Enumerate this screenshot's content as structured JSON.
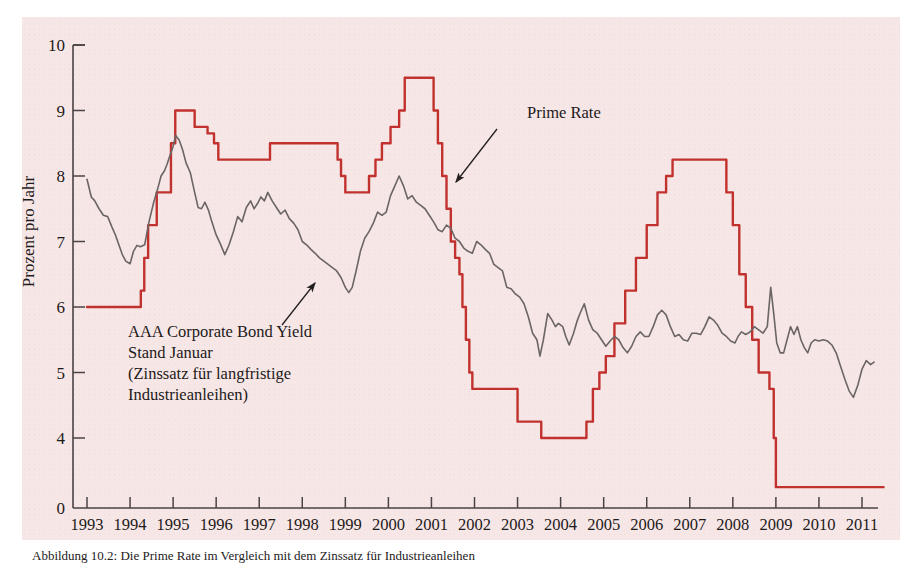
{
  "figure": {
    "background_color": "#ffffff",
    "panel_color": "#f7e6e6",
    "axis_color": "#4a4345",
    "caption": "Abbildung 10.2: Die Prime Rate im Vergleich mit dem Zinssatz für Industrieanleihen"
  },
  "chart_data": {
    "type": "line",
    "title": "",
    "subtitle": "",
    "xlabel": "",
    "ylabel": "Prozent pro Jahr",
    "xlim": [
      1993,
      2011.5
    ],
    "ylim": [
      3.55,
      10
    ],
    "y_axis_broken_at_zero": true,
    "grid": false,
    "legend": "annotations",
    "x_ticks": [
      1993,
      1994,
      1995,
      1996,
      1997,
      1998,
      1999,
      2000,
      2001,
      2002,
      2003,
      2004,
      2005,
      2006,
      2007,
      2008,
      2009,
      2010,
      2011
    ],
    "x_tick_labels": [
      "1993",
      "1994",
      "1995",
      "1996",
      "1997",
      "1998",
      "1999",
      "2000",
      "2001",
      "2002",
      "2003",
      "2004",
      "2005",
      "2006",
      "2007",
      "2008",
      "2009",
      "2010",
      "2011"
    ],
    "y_ticks": [
      4,
      5,
      6,
      7,
      8,
      9,
      10
    ],
    "y_tick_labels": [
      "4",
      "5",
      "6",
      "7",
      "8",
      "9",
      "10"
    ],
    "y_zero_label": "0",
    "series": [
      {
        "name": "Prime Rate",
        "color": "#c1322f",
        "width": 2.4,
        "step": true,
        "annotation": {
          "label": "Prime Rate",
          "text_x": 527,
          "text_y": 118,
          "arrow_from_x": 497,
          "arrow_from_y": 129,
          "arrow_to_x": 456,
          "arrow_to_y": 182
        },
        "points": [
          [
            1993.0,
            6.0
          ],
          [
            1993.2,
            6.0
          ],
          [
            1993.5,
            6.0
          ],
          [
            1993.8,
            6.0
          ],
          [
            1994.0,
            6.0
          ],
          [
            1994.15,
            6.0
          ],
          [
            1994.25,
            6.25
          ],
          [
            1994.33,
            6.75
          ],
          [
            1994.42,
            7.25
          ],
          [
            1994.55,
            7.25
          ],
          [
            1994.62,
            7.75
          ],
          [
            1994.75,
            7.75
          ],
          [
            1994.95,
            8.5
          ],
          [
            1995.05,
            9.0
          ],
          [
            1995.4,
            9.0
          ],
          [
            1995.5,
            8.75
          ],
          [
            1995.7,
            8.75
          ],
          [
            1995.8,
            8.65
          ],
          [
            1995.95,
            8.5
          ],
          [
            1996.05,
            8.25
          ],
          [
            1996.4,
            8.25
          ],
          [
            1997.0,
            8.25
          ],
          [
            1997.25,
            8.5
          ],
          [
            1998.0,
            8.5
          ],
          [
            1998.75,
            8.5
          ],
          [
            1998.82,
            8.25
          ],
          [
            1998.9,
            8.0
          ],
          [
            1999.0,
            7.75
          ],
          [
            1999.45,
            7.75
          ],
          [
            1999.55,
            8.0
          ],
          [
            1999.7,
            8.25
          ],
          [
            1999.85,
            8.5
          ],
          [
            2000.05,
            8.75
          ],
          [
            2000.25,
            9.0
          ],
          [
            2000.38,
            9.5
          ],
          [
            2000.5,
            9.5
          ],
          [
            2000.95,
            9.5
          ],
          [
            2001.05,
            9.0
          ],
          [
            2001.15,
            8.5
          ],
          [
            2001.25,
            8.0
          ],
          [
            2001.35,
            7.5
          ],
          [
            2001.45,
            7.0
          ],
          [
            2001.55,
            6.75
          ],
          [
            2001.65,
            6.5
          ],
          [
            2001.72,
            6.0
          ],
          [
            2001.8,
            5.5
          ],
          [
            2001.88,
            5.0
          ],
          [
            2001.95,
            4.75
          ],
          [
            2002.05,
            4.75
          ],
          [
            2002.6,
            4.75
          ],
          [
            2002.95,
            4.75
          ],
          [
            2003.0,
            4.25
          ],
          [
            2003.45,
            4.25
          ],
          [
            2003.55,
            4.0
          ],
          [
            2004.0,
            4.0
          ],
          [
            2004.5,
            4.0
          ],
          [
            2004.6,
            4.25
          ],
          [
            2004.75,
            4.75
          ],
          [
            2004.9,
            5.0
          ],
          [
            2005.05,
            5.25
          ],
          [
            2005.25,
            5.75
          ],
          [
            2005.5,
            6.25
          ],
          [
            2005.75,
            6.75
          ],
          [
            2006.0,
            7.25
          ],
          [
            2006.25,
            7.75
          ],
          [
            2006.45,
            8.0
          ],
          [
            2006.6,
            8.25
          ],
          [
            2007.0,
            8.25
          ],
          [
            2007.5,
            8.25
          ],
          [
            2007.72,
            8.25
          ],
          [
            2007.85,
            7.75
          ],
          [
            2008.0,
            7.25
          ],
          [
            2008.15,
            6.5
          ],
          [
            2008.3,
            6.0
          ],
          [
            2008.45,
            5.5
          ],
          [
            2008.6,
            5.0
          ],
          [
            2008.75,
            5.0
          ],
          [
            2008.85,
            4.75
          ],
          [
            2008.95,
            4.0
          ],
          [
            2009.0,
            3.25
          ],
          [
            2009.1,
            3.25
          ],
          [
            2010.0,
            3.25
          ],
          [
            2011.0,
            3.25
          ],
          [
            2011.5,
            3.25
          ]
        ]
      },
      {
        "name": "AAA Corporate Bond Yield",
        "color": "#6b6566",
        "width": 1.6,
        "step": false,
        "annotation": {
          "label_lines": [
            "AAA Corporate Bond Yield",
            "Stand Januar",
            "(Zinssatz für langfristige",
            "Industrieanleihen)"
          ],
          "text_x": 128,
          "text_y": 337,
          "line_height": 21,
          "arrow_from_x": 282,
          "arrow_from_y": 325,
          "arrow_to_x": 315,
          "arrow_to_y": 283
        },
        "points": [
          [
            1993.0,
            7.95
          ],
          [
            1993.1,
            7.68
          ],
          [
            1993.18,
            7.62
          ],
          [
            1993.28,
            7.5
          ],
          [
            1993.38,
            7.4
          ],
          [
            1993.48,
            7.38
          ],
          [
            1993.58,
            7.22
          ],
          [
            1993.66,
            7.1
          ],
          [
            1993.74,
            6.95
          ],
          [
            1993.82,
            6.8
          ],
          [
            1993.9,
            6.7
          ],
          [
            1994.0,
            6.66
          ],
          [
            1994.08,
            6.85
          ],
          [
            1994.16,
            6.94
          ],
          [
            1994.24,
            6.92
          ],
          [
            1994.34,
            6.95
          ],
          [
            1994.44,
            7.3
          ],
          [
            1994.55,
            7.6
          ],
          [
            1994.64,
            7.8
          ],
          [
            1994.72,
            8.0
          ],
          [
            1994.8,
            8.08
          ],
          [
            1994.86,
            8.18
          ],
          [
            1994.92,
            8.3
          ],
          [
            1995.0,
            8.45
          ],
          [
            1995.06,
            8.62
          ],
          [
            1995.14,
            8.55
          ],
          [
            1995.22,
            8.4
          ],
          [
            1995.3,
            8.2
          ],
          [
            1995.4,
            8.05
          ],
          [
            1995.5,
            7.75
          ],
          [
            1995.58,
            7.52
          ],
          [
            1995.66,
            7.5
          ],
          [
            1995.74,
            7.6
          ],
          [
            1995.82,
            7.48
          ],
          [
            1995.9,
            7.3
          ],
          [
            1996.0,
            7.1
          ],
          [
            1996.1,
            6.96
          ],
          [
            1996.2,
            6.8
          ],
          [
            1996.3,
            6.95
          ],
          [
            1996.4,
            7.15
          ],
          [
            1996.5,
            7.38
          ],
          [
            1996.6,
            7.3
          ],
          [
            1996.7,
            7.52
          ],
          [
            1996.8,
            7.62
          ],
          [
            1996.88,
            7.5
          ],
          [
            1996.96,
            7.58
          ],
          [
            1997.04,
            7.68
          ],
          [
            1997.12,
            7.62
          ],
          [
            1997.2,
            7.75
          ],
          [
            1997.3,
            7.62
          ],
          [
            1997.4,
            7.52
          ],
          [
            1997.5,
            7.42
          ],
          [
            1997.6,
            7.48
          ],
          [
            1997.7,
            7.35
          ],
          [
            1997.8,
            7.28
          ],
          [
            1997.9,
            7.18
          ],
          [
            1998.0,
            7.0
          ],
          [
            1998.1,
            6.95
          ],
          [
            1998.2,
            6.88
          ],
          [
            1998.3,
            6.82
          ],
          [
            1998.4,
            6.75
          ],
          [
            1998.5,
            6.7
          ],
          [
            1998.6,
            6.65
          ],
          [
            1998.7,
            6.6
          ],
          [
            1998.8,
            6.55
          ],
          [
            1998.9,
            6.45
          ],
          [
            1999.0,
            6.3
          ],
          [
            1999.08,
            6.22
          ],
          [
            1999.16,
            6.3
          ],
          [
            1999.25,
            6.55
          ],
          [
            1999.35,
            6.85
          ],
          [
            1999.45,
            7.05
          ],
          [
            1999.55,
            7.15
          ],
          [
            1999.65,
            7.28
          ],
          [
            1999.75,
            7.45
          ],
          [
            1999.85,
            7.4
          ],
          [
            1999.95,
            7.45
          ],
          [
            2000.05,
            7.7
          ],
          [
            2000.15,
            7.85
          ],
          [
            2000.25,
            8.0
          ],
          [
            2000.35,
            7.85
          ],
          [
            2000.45,
            7.65
          ],
          [
            2000.55,
            7.7
          ],
          [
            2000.65,
            7.6
          ],
          [
            2000.75,
            7.55
          ],
          [
            2000.85,
            7.5
          ],
          [
            2000.95,
            7.4
          ],
          [
            2001.05,
            7.3
          ],
          [
            2001.15,
            7.18
          ],
          [
            2001.25,
            7.15
          ],
          [
            2001.35,
            7.25
          ],
          [
            2001.45,
            7.2
          ],
          [
            2001.55,
            7.05
          ],
          [
            2001.65,
            7.0
          ],
          [
            2001.75,
            6.9
          ],
          [
            2001.85,
            6.85
          ],
          [
            2001.95,
            6.82
          ],
          [
            2002.05,
            7.0
          ],
          [
            2002.15,
            6.95
          ],
          [
            2002.25,
            6.88
          ],
          [
            2002.35,
            6.82
          ],
          [
            2002.45,
            6.65
          ],
          [
            2002.55,
            6.6
          ],
          [
            2002.65,
            6.55
          ],
          [
            2002.75,
            6.3
          ],
          [
            2002.85,
            6.28
          ],
          [
            2002.95,
            6.2
          ],
          [
            2003.05,
            6.15
          ],
          [
            2003.15,
            6.05
          ],
          [
            2003.25,
            5.85
          ],
          [
            2003.35,
            5.6
          ],
          [
            2003.45,
            5.5
          ],
          [
            2003.52,
            5.25
          ],
          [
            2003.6,
            5.5
          ],
          [
            2003.7,
            5.9
          ],
          [
            2003.8,
            5.8
          ],
          [
            2003.88,
            5.7
          ],
          [
            2003.95,
            5.75
          ],
          [
            2004.05,
            5.7
          ],
          [
            2004.12,
            5.55
          ],
          [
            2004.2,
            5.42
          ],
          [
            2004.3,
            5.6
          ],
          [
            2004.38,
            5.78
          ],
          [
            2004.45,
            5.9
          ],
          [
            2004.55,
            6.05
          ],
          [
            2004.65,
            5.8
          ],
          [
            2004.75,
            5.65
          ],
          [
            2004.85,
            5.6
          ],
          [
            2004.95,
            5.5
          ],
          [
            2005.05,
            5.4
          ],
          [
            2005.15,
            5.48
          ],
          [
            2005.25,
            5.55
          ],
          [
            2005.35,
            5.5
          ],
          [
            2005.45,
            5.38
          ],
          [
            2005.55,
            5.3
          ],
          [
            2005.65,
            5.4
          ],
          [
            2005.75,
            5.55
          ],
          [
            2005.85,
            5.62
          ],
          [
            2005.95,
            5.55
          ],
          [
            2006.05,
            5.55
          ],
          [
            2006.15,
            5.7
          ],
          [
            2006.25,
            5.88
          ],
          [
            2006.35,
            5.95
          ],
          [
            2006.45,
            5.88
          ],
          [
            2006.55,
            5.7
          ],
          [
            2006.65,
            5.55
          ],
          [
            2006.75,
            5.58
          ],
          [
            2006.85,
            5.5
          ],
          [
            2006.95,
            5.48
          ],
          [
            2007.05,
            5.6
          ],
          [
            2007.15,
            5.6
          ],
          [
            2007.25,
            5.58
          ],
          [
            2007.35,
            5.7
          ],
          [
            2007.45,
            5.85
          ],
          [
            2007.55,
            5.8
          ],
          [
            2007.65,
            5.72
          ],
          [
            2007.75,
            5.6
          ],
          [
            2007.85,
            5.55
          ],
          [
            2007.95,
            5.48
          ],
          [
            2008.05,
            5.45
          ],
          [
            2008.12,
            5.55
          ],
          [
            2008.2,
            5.62
          ],
          [
            2008.3,
            5.58
          ],
          [
            2008.4,
            5.62
          ],
          [
            2008.5,
            5.7
          ],
          [
            2008.6,
            5.65
          ],
          [
            2008.7,
            5.6
          ],
          [
            2008.8,
            5.7
          ],
          [
            2008.88,
            6.3
          ],
          [
            2008.95,
            5.9
          ],
          [
            2009.02,
            5.45
          ],
          [
            2009.1,
            5.3
          ],
          [
            2009.18,
            5.3
          ],
          [
            2009.26,
            5.5
          ],
          [
            2009.34,
            5.7
          ],
          [
            2009.42,
            5.58
          ],
          [
            2009.5,
            5.7
          ],
          [
            2009.58,
            5.5
          ],
          [
            2009.66,
            5.38
          ],
          [
            2009.74,
            5.3
          ],
          [
            2009.82,
            5.45
          ],
          [
            2009.9,
            5.5
          ],
          [
            2010.0,
            5.48
          ],
          [
            2010.1,
            5.5
          ],
          [
            2010.2,
            5.48
          ],
          [
            2010.3,
            5.42
          ],
          [
            2010.4,
            5.3
          ],
          [
            2010.5,
            5.1
          ],
          [
            2010.6,
            4.9
          ],
          [
            2010.7,
            4.72
          ],
          [
            2010.8,
            4.62
          ],
          [
            2010.9,
            4.8
          ],
          [
            2011.0,
            5.05
          ],
          [
            2011.1,
            5.18
          ],
          [
            2011.2,
            5.12
          ],
          [
            2011.28,
            5.16
          ]
        ]
      }
    ]
  }
}
